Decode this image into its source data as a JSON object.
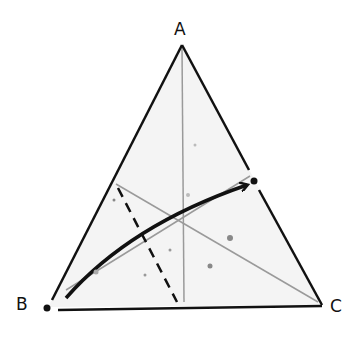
{
  "diagram": {
    "type": "ternary-triangle",
    "vertices": [
      {
        "label": "A",
        "position": "top"
      },
      {
        "label": "B",
        "position": "bottom-left"
      },
      {
        "label": "C",
        "position": "bottom-right"
      }
    ],
    "elements": {
      "medians": "three grey lines from each vertex to midpoint of opposite side",
      "dashed_line": "dashed line from left side (near B-A) down to bottom side",
      "arrow": "curved bold arrow from near B toward point on side A-C",
      "point_on_AC": "black dot on side A-C",
      "point_B": "black dot at vertex B"
    }
  },
  "labels": {
    "a": "A",
    "b": "B",
    "c": "C"
  },
  "colors": {
    "outline": "#111111",
    "median": "#9a9a9a",
    "fill": "#f4f4f4"
  }
}
